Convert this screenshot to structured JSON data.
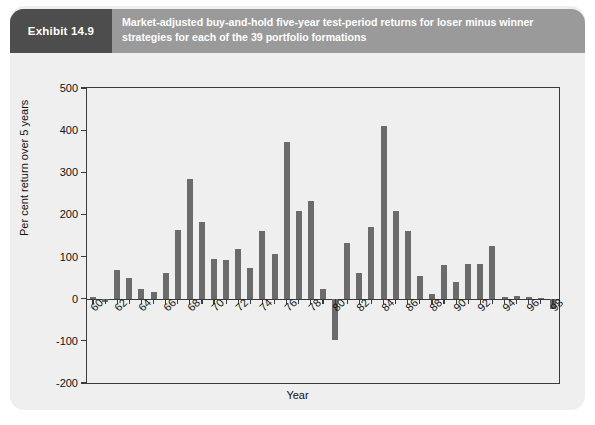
{
  "exhibit": {
    "number_label": "Exhibit 14.9",
    "caption": "Market-adjusted buy-and-hold five-year test-period returns for loser minus winner strategies for each of the 39 portfolio formations",
    "tab_color": "#4d4d4d",
    "banner_color": "#9a9a9a",
    "panel_color": "#efefef"
  },
  "chart_data": {
    "type": "bar",
    "title": "Market-adjusted buy-and-hold five-year test-period returns for loser minus winner strategies for each of the 39 portfolio formations",
    "xlabel": "Year",
    "ylabel": "Per cent return over 5 years",
    "ylim": [
      -200,
      500
    ],
    "ytick_values": [
      500,
      400,
      300,
      200,
      100,
      0,
      -100,
      -200
    ],
    "ytick_labels": [
      "500",
      "400",
      "300",
      "200",
      "100",
      "0",
      "-100",
      "-200"
    ],
    "xtick_labels": [
      "60",
      "62",
      "64",
      "66",
      "68",
      "70",
      "72",
      "74",
      "76",
      "78",
      "80",
      "82",
      "84",
      "86",
      "88",
      "90",
      "92",
      "94",
      "96",
      "98"
    ],
    "grid": false,
    "legend": false,
    "bar_color": "#6b6b6b",
    "categories": [
      "60",
      "61",
      "62",
      "63",
      "64",
      "65",
      "66",
      "67",
      "68",
      "69",
      "70",
      "71",
      "72",
      "73",
      "74",
      "75",
      "76",
      "77",
      "78",
      "79",
      "80",
      "81",
      "82",
      "83",
      "84",
      "85",
      "86",
      "87",
      "88",
      "89",
      "90",
      "91",
      "92",
      "93",
      "94",
      "95",
      "96",
      "97",
      "98"
    ],
    "values": [
      5,
      -8,
      68,
      50,
      22,
      16,
      60,
      163,
      283,
      183,
      95,
      92,
      118,
      73,
      160,
      105,
      373,
      207,
      232,
      22,
      -98,
      133,
      62,
      170,
      411,
      208,
      160,
      55,
      12,
      80,
      40,
      82,
      82,
      125,
      5,
      6,
      3,
      2,
      -25
    ]
  },
  "axes": {
    "y_title": "Per cent return over 5 years",
    "x_title": "Year"
  }
}
